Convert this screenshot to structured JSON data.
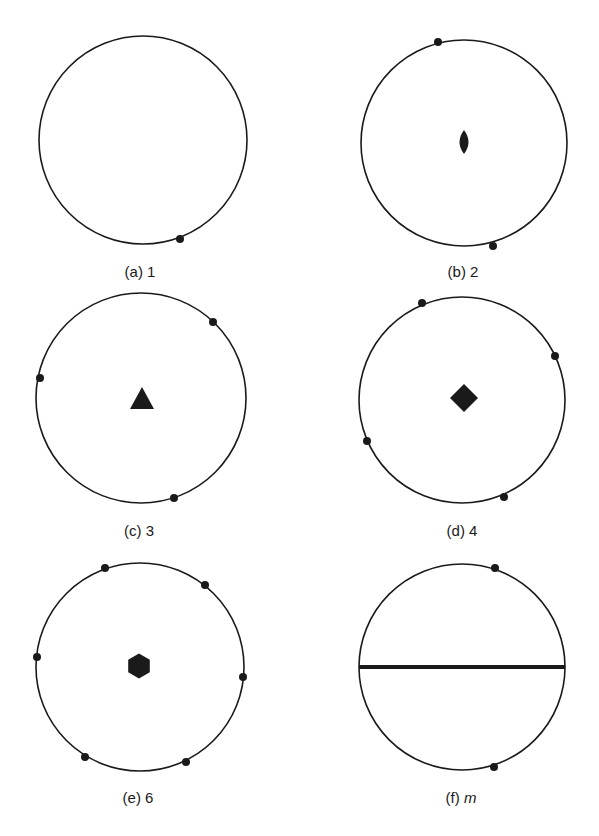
{
  "figure": {
    "stroke_color": "#1a1a1a",
    "background": "#ffffff",
    "panels": [
      {
        "id": "a",
        "label_prefix": "(a)",
        "label_symbol": "1",
        "italic": false,
        "circle": {
          "cx": 143,
          "cy": 140,
          "r": 104
        },
        "label_pos": {
          "x": 140,
          "y": 277
        },
        "center_symbol": "none",
        "points": [
          [
            180,
            239
          ]
        ]
      },
      {
        "id": "b",
        "label_prefix": "(b)",
        "label_symbol": "2",
        "italic": false,
        "circle": {
          "cx": 464,
          "cy": 143,
          "r": 103
        },
        "label_pos": {
          "x": 463,
          "y": 277
        },
        "center_symbol": "lens",
        "center": {
          "x": 464,
          "y": 142
        },
        "points": [
          [
            438,
            42
          ],
          [
            493,
            246
          ]
        ]
      },
      {
        "id": "c",
        "label_prefix": "(c)",
        "label_symbol": "3",
        "italic": false,
        "circle": {
          "cx": 141,
          "cy": 398,
          "r": 105
        },
        "label_pos": {
          "x": 139,
          "y": 536
        },
        "center_symbol": "triangle",
        "center": {
          "x": 142,
          "y": 398
        },
        "points": [
          [
            213,
            322
          ],
          [
            40,
            378
          ],
          [
            174,
            498
          ]
        ]
      },
      {
        "id": "d",
        "label_prefix": "(d)",
        "label_symbol": "4",
        "italic": false,
        "circle": {
          "cx": 462,
          "cy": 400,
          "r": 103
        },
        "label_pos": {
          "x": 462,
          "y": 536
        },
        "center_symbol": "square",
        "center": {
          "x": 464,
          "y": 398
        },
        "points": [
          [
            422,
            303
          ],
          [
            555,
            356
          ],
          [
            367,
            441
          ],
          [
            504,
            497
          ]
        ]
      },
      {
        "id": "e",
        "label_prefix": "(e)",
        "label_symbol": "6",
        "italic": false,
        "circle": {
          "cx": 140,
          "cy": 667,
          "r": 104
        },
        "label_pos": {
          "x": 138,
          "y": 803
        },
        "center_symbol": "hexagon",
        "center": {
          "x": 139,
          "y": 666
        },
        "points": [
          [
            105,
            568
          ],
          [
            205,
            585
          ],
          [
            37,
            657
          ],
          [
            243,
            677
          ],
          [
            85,
            757
          ],
          [
            186,
            762
          ]
        ]
      },
      {
        "id": "f",
        "label_prefix": "(f)",
        "label_symbol": "m",
        "italic": true,
        "circle": {
          "cx": 462,
          "cy": 667,
          "r": 103
        },
        "label_pos": {
          "x": 461,
          "y": 803
        },
        "center_symbol": "mirror-line",
        "mirror_y": 667,
        "points": [
          [
            495,
            568
          ],
          [
            494,
            767
          ]
        ]
      }
    ]
  }
}
